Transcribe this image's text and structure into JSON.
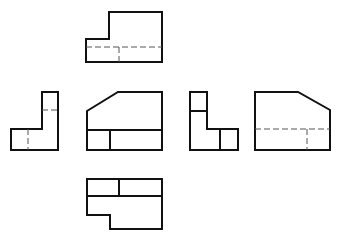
{
  "diagram": {
    "type": "orthographic-projection-six-views",
    "colors": {
      "background": "#ffffff",
      "visible_line": "#111111",
      "hidden_line": "#555555"
    },
    "views": [
      {
        "name": "top-view",
        "outline": "86,39 109,39 109,12 162,12 162,62 86,62",
        "visible_lines": [],
        "hidden_lines": [
          "86,47 162,47",
          "119,47 119,62"
        ]
      },
      {
        "name": "left-view",
        "outline": "42,92 58,92 58,150 11,150 11,129 42,129",
        "visible_lines": [],
        "hidden_lines": [
          "42,110 58,110",
          "28,129 28,150"
        ]
      },
      {
        "name": "front-view",
        "outline": "87,111 118,92 162,92 162,150 87,150",
        "visible_lines": [
          "87,130 162,130",
          "110,130 110,150"
        ],
        "hidden_lines": []
      },
      {
        "name": "right-view",
        "outline": "190,92 207,92 207,129 238,129 238,150 190,150",
        "visible_lines": [
          "190,111 207,111",
          "220,129 220,150"
        ],
        "hidden_lines": []
      },
      {
        "name": "back-view",
        "outline": "255,92 298,92 330,110 330,150 255,150",
        "visible_lines": [],
        "hidden_lines": [
          "255,129 330,129",
          "307,129 307,150"
        ]
      },
      {
        "name": "bottom-view",
        "outline": "87,179 162,179 162,229 110,229 110,215 87,215",
        "visible_lines": [
          "87,196 162,196",
          "119,179 119,196"
        ],
        "hidden_lines": []
      }
    ]
  }
}
